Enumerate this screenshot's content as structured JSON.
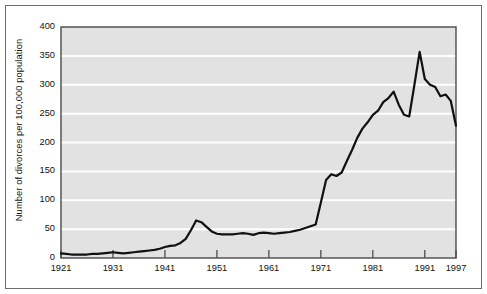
{
  "chart_data": {
    "type": "line",
    "title": "",
    "xlabel": "",
    "ylabel": "Number of divorces per 100,000 population",
    "xlim": [
      1921,
      1997
    ],
    "ylim": [
      0,
      400
    ],
    "yticks": [
      0,
      50,
      100,
      150,
      200,
      250,
      300,
      350,
      400
    ],
    "ytick_labels": [
      "0",
      "50",
      "100",
      "150",
      "200",
      "250",
      "300",
      "350",
      "400"
    ],
    "xticks": [
      1921,
      1931,
      1941,
      1951,
      1961,
      1971,
      1981,
      1991,
      1997
    ],
    "xtick_labels": [
      "1921",
      "1931",
      "1941",
      "1951",
      "1961",
      "1971",
      "1981",
      "1991",
      "1997"
    ],
    "grid": "horizontal-white",
    "legend": "none",
    "series": [
      {
        "name": "Divorce rate",
        "x": [
          1921,
          1922,
          1923,
          1924,
          1925,
          1926,
          1927,
          1928,
          1929,
          1930,
          1931,
          1932,
          1933,
          1934,
          1935,
          1936,
          1937,
          1938,
          1939,
          1940,
          1941,
          1942,
          1943,
          1944,
          1945,
          1946,
          1947,
          1948,
          1949,
          1950,
          1951,
          1952,
          1953,
          1954,
          1955,
          1956,
          1957,
          1958,
          1959,
          1960,
          1961,
          1962,
          1963,
          1964,
          1965,
          1966,
          1967,
          1968,
          1969,
          1970,
          1971,
          1972,
          1973,
          1974,
          1975,
          1976,
          1977,
          1978,
          1979,
          1980,
          1981,
          1982,
          1983,
          1984,
          1985,
          1986,
          1987,
          1988,
          1989,
          1990,
          1991,
          1992,
          1993,
          1994,
          1995,
          1996,
          1997
        ],
        "y": [
          8,
          7,
          6,
          6,
          6,
          6,
          7,
          7,
          8,
          9,
          10,
          9,
          8,
          9,
          10,
          11,
          12,
          13,
          14,
          16,
          19,
          21,
          22,
          26,
          33,
          48,
          65,
          62,
          54,
          46,
          42,
          41,
          41,
          41,
          42,
          43,
          42,
          40,
          43,
          44,
          43,
          42,
          43,
          44,
          45,
          47,
          49,
          52,
          55,
          58,
          96,
          135,
          145,
          142,
          148,
          168,
          187,
          208,
          224,
          235,
          248,
          255,
          270,
          277,
          288,
          265,
          248,
          245,
          300,
          357,
          310,
          300,
          296,
          280,
          283,
          272,
          229
        ]
      }
    ]
  },
  "axes": {
    "plot_background": "#e2e2e2",
    "gridline_color": "#ffffff",
    "line_color": "#111111",
    "axis_color": "#4a4a4a",
    "frame_color": "#6b6b6b"
  }
}
